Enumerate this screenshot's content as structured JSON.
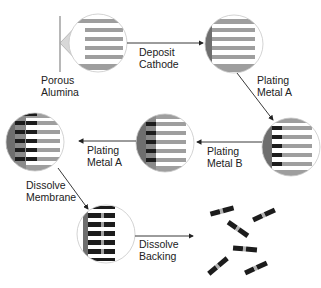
{
  "diagram": {
    "type": "process-flow",
    "colors": {
      "pore_gray": "#9e9e9e",
      "membrane_white": "#ffffff",
      "cathode_gray": "#7a7a7a",
      "metal_a_black": "#1c1c1c",
      "metal_b_gray": "#a0a0a0",
      "circle_outline": "#c8c8c8",
      "arrow": "#222222",
      "text": "#222222"
    },
    "stages": [
      {
        "id": "porous-alumina",
        "description": "Empty pores in alumina membrane"
      },
      {
        "id": "cathode-deposited",
        "description": "Cathode backing on left side"
      },
      {
        "id": "metal-a-plated",
        "description": "Metal A segment in pores"
      },
      {
        "id": "metal-b-plated",
        "description": "Metal B segment after metal A"
      },
      {
        "id": "metal-a-plated-again",
        "description": "Second Metal A segment"
      },
      {
        "id": "membrane-dissolved",
        "description": "Rods on backing, membrane removed"
      },
      {
        "id": "free-nanorods",
        "description": "Released striped nanorods"
      }
    ],
    "labels": {
      "porous_alumina_line1": "Porous",
      "porous_alumina_line2": "Alumina",
      "deposit_cathode_line1": "Deposit",
      "deposit_cathode_line2": "Cathode",
      "plating_metal_a_1_line1": "Plating",
      "plating_metal_a_1_line2": "Metal A",
      "plating_metal_b_line1": "Plating",
      "plating_metal_b_line2": "Metal B",
      "plating_metal_a_2_line1": "Plating",
      "plating_metal_a_2_line2": "Metal A",
      "dissolve_membrane_line1": "Dissolve",
      "dissolve_membrane_line2": "Membrane",
      "dissolve_backing_line1": "Dissolve",
      "dissolve_backing_line2": "Backing"
    },
    "nanorod_count": 6
  }
}
